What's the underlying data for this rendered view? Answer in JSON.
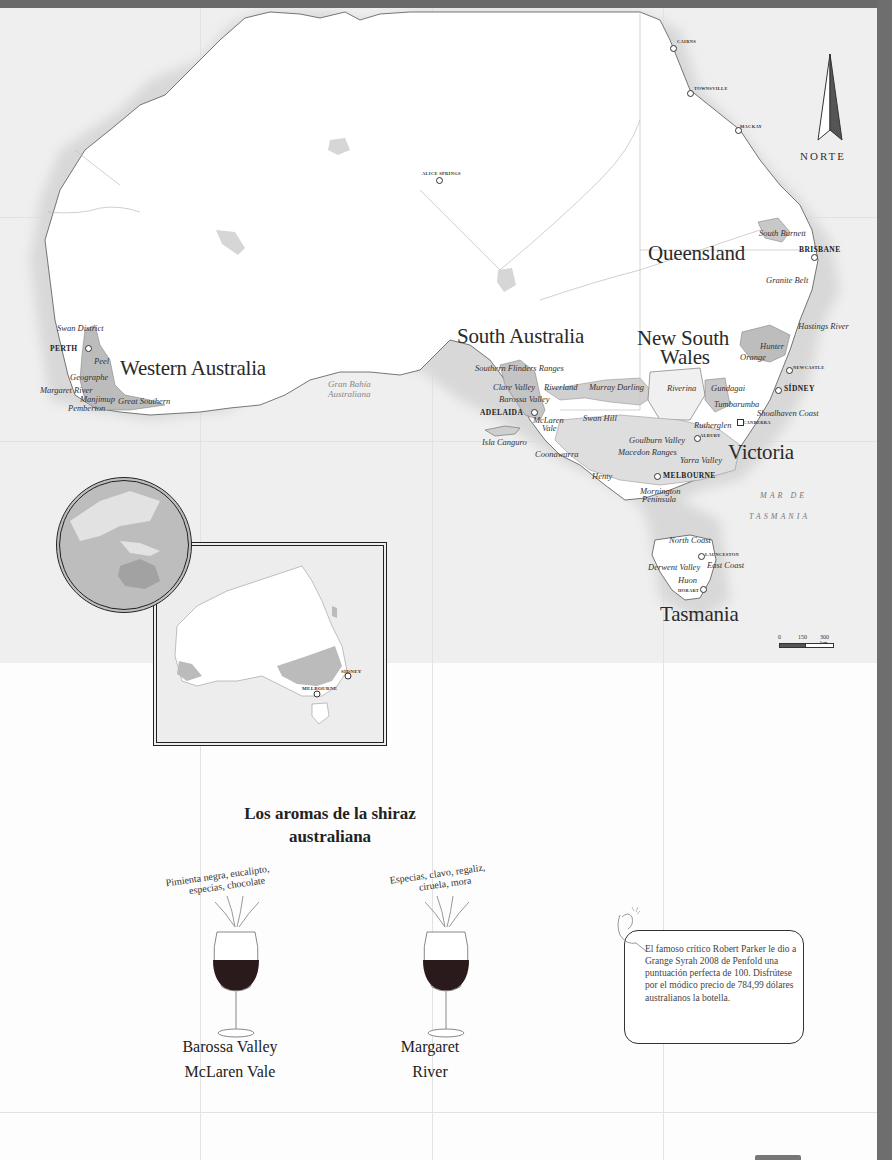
{
  "map": {
    "compass_label": "NORTE",
    "states": [
      {
        "id": "wa",
        "label": "Western Australia",
        "x": 120,
        "y": 358
      },
      {
        "id": "sa",
        "label": "South Australia",
        "x": 457,
        "y": 326
      },
      {
        "id": "nsw1",
        "label": "New South",
        "x": 637,
        "y": 328
      },
      {
        "id": "nsw2",
        "label": "Wales",
        "x": 660,
        "y": 347
      },
      {
        "id": "qld",
        "label": "Queensland",
        "x": 648,
        "y": 243
      },
      {
        "id": "vic",
        "label": "Victoria",
        "x": 728,
        "y": 442
      },
      {
        "id": "tas",
        "label": "Tasmania",
        "x": 660,
        "y": 604
      }
    ],
    "cities": [
      {
        "label": "CAIRNS",
        "x": 677,
        "y": 40,
        "dot_x": 672,
        "dot_y": 47,
        "small": true
      },
      {
        "label": "TOWNSVILLE",
        "x": 694,
        "y": 87,
        "dot_x": 689,
        "dot_y": 92,
        "small": true
      },
      {
        "label": "MACKAY",
        "x": 740,
        "y": 125,
        "dot_x": 737,
        "dot_y": 129,
        "small": true
      },
      {
        "label": "ALICE SPRINGS",
        "x": 422,
        "y": 174,
        "dot_x": 438,
        "dot_y": 179,
        "small": true
      },
      {
        "label": "BRISBANE",
        "x": 799,
        "y": 248,
        "dot_x": 813,
        "dot_y": 256,
        "small": false
      },
      {
        "label": "NEWCASTLE",
        "x": 795,
        "y": 367,
        "dot_x": 788,
        "dot_y": 369,
        "small": true
      },
      {
        "label": "SÍDNEY",
        "x": 785,
        "y": 385,
        "dot_x": 777,
        "dot_y": 389,
        "small": false
      },
      {
        "label": "CANBERRA",
        "x": 743,
        "y": 422,
        "dot_x": 739,
        "dot_y": 421,
        "small": true
      },
      {
        "label": "ALBURY",
        "x": 700,
        "y": 435,
        "dot_x": 696,
        "dot_y": 437,
        "small": true
      },
      {
        "label": "MELBOURNE",
        "x": 663,
        "y": 472,
        "dot_x": 656,
        "dot_y": 475,
        "small": false
      },
      {
        "label": "ADELAIDA",
        "x": 480,
        "y": 409,
        "dot_x": 533,
        "dot_y": 411,
        "small": false
      },
      {
        "label": "PERTH",
        "x": 50,
        "y": 345,
        "dot_x": 87,
        "dot_y": 347,
        "small": false
      },
      {
        "label": "LAUNCESTON",
        "x": 706,
        "y": 554,
        "dot_x": 700,
        "dot_y": 555,
        "small": true
      },
      {
        "label": "HOBART",
        "x": 678,
        "y": 590,
        "dot_x": 702,
        "dot_y": 588,
        "small": true
      }
    ],
    "regions": [
      {
        "label": "Swan District",
        "x": 57,
        "y": 324
      },
      {
        "label": "Peel",
        "x": 94,
        "y": 357
      },
      {
        "label": "Geographe",
        "x": 70,
        "y": 373
      },
      {
        "label": "Margaret River",
        "x": 40,
        "y": 386
      },
      {
        "label": "Manjimup",
        "x": 80,
        "y": 395
      },
      {
        "label": "Great Southern",
        "x": 118,
        "y": 397
      },
      {
        "label": "Pemberton",
        "x": 68,
        "y": 404
      },
      {
        "label": "Southern Flinders Ranges",
        "x": 475,
        "y": 364
      },
      {
        "label": "Clare Valley",
        "x": 493,
        "y": 383
      },
      {
        "label": "Riverland",
        "x": 544,
        "y": 383
      },
      {
        "label": "Murray Darling",
        "x": 589,
        "y": 383
      },
      {
        "label": "Barossa Valley",
        "x": 499,
        "y": 395
      },
      {
        "label": "McLaren",
        "x": 533,
        "y": 416
      },
      {
        "label": "Vale",
        "x": 542,
        "y": 424
      },
      {
        "label": "Swan Hill",
        "x": 583,
        "y": 414
      },
      {
        "label": "Isla Canguro",
        "x": 482,
        "y": 438
      },
      {
        "label": "Coonawarra",
        "x": 535,
        "y": 450
      },
      {
        "label": "Henty",
        "x": 592,
        "y": 472
      },
      {
        "label": "Riverina",
        "x": 667,
        "y": 384
      },
      {
        "label": "Gundagai",
        "x": 711,
        "y": 384
      },
      {
        "label": "Tumbarumba",
        "x": 714,
        "y": 400
      },
      {
        "label": "Shoalhaven Coast",
        "x": 757,
        "y": 409
      },
      {
        "label": "Rutherglen",
        "x": 694,
        "y": 421
      },
      {
        "label": "Goulburn Valley",
        "x": 629,
        "y": 436
      },
      {
        "label": "Macedon Ranges",
        "x": 618,
        "y": 448
      },
      {
        "label": "Yarra Valley",
        "x": 680,
        "y": 456
      },
      {
        "label": "Mornington",
        "x": 640,
        "y": 487
      },
      {
        "label": "Peninsula",
        "x": 642,
        "y": 495
      },
      {
        "label": "South Burnett",
        "x": 759,
        "y": 229
      },
      {
        "label": "Granite Belt",
        "x": 766,
        "y": 276
      },
      {
        "label": "Hastings River",
        "x": 798,
        "y": 322
      },
      {
        "label": "Hunter",
        "x": 760,
        "y": 342
      },
      {
        "label": "Orange",
        "x": 740,
        "y": 353
      },
      {
        "label": "North Coast",
        "x": 669,
        "y": 536
      },
      {
        "label": "Derwent Valley",
        "x": 648,
        "y": 563
      },
      {
        "label": "East Coast",
        "x": 707,
        "y": 561
      },
      {
        "label": "Huon",
        "x": 678,
        "y": 576
      }
    ],
    "sea_labels": [
      {
        "label": "MAR DE",
        "x": 760,
        "y": 492
      },
      {
        "label": "TASMANIA",
        "x": 749,
        "y": 513
      }
    ],
    "bay_label": {
      "line1": "Gran Bahía",
      "line2": "Australiana",
      "x": 328,
      "y": 380
    },
    "scale": {
      "zero": "0",
      "mid": "150",
      "max": "300 km"
    }
  },
  "inset": {
    "cities": [
      {
        "label": "SÍDNEY",
        "x": 184,
        "y": 125
      },
      {
        "label": "MELBOURNE",
        "x": 145,
        "y": 142
      }
    ]
  },
  "aromas": {
    "title_line1": "Los aromas de la shiraz",
    "title_line2": "australiana",
    "wines": [
      {
        "arc_line1": "Pimienta negra, eucalipto,",
        "arc_line2": "especias, chocolate",
        "region_line1": "Barossa Valley",
        "region_line2": "McLaren Vale",
        "wine_color": "#2a1a1c"
      },
      {
        "arc_line1": "Especias, clavo, regaliz,",
        "arc_line2": "ciruela, mora",
        "region_line1": "Margaret",
        "region_line2": "River",
        "wine_color": "#2a1a1c"
      }
    ]
  },
  "note": {
    "text": "El famoso crítico Robert Parker le dio a Grange Syrah 2008 de Penfold una puntuación perfecta de 100. Disfrútese por el módico precio de 784,99 dólares australianos la botella."
  }
}
